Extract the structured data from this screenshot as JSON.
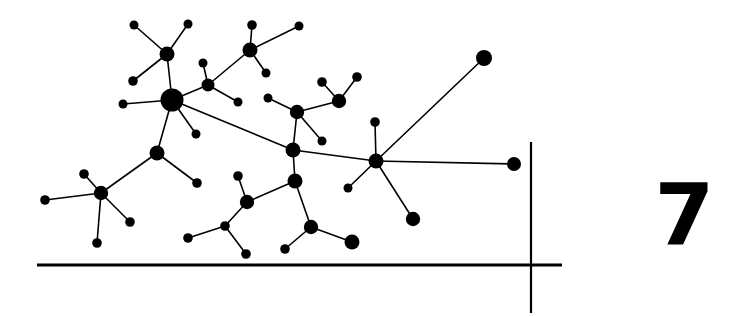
{
  "figure": {
    "number_label": "7",
    "background_color": "#ffffff",
    "ink_color": "#000000"
  },
  "rules": {
    "baseline": {
      "x1": 37,
      "y1": 265,
      "x2": 562,
      "y2": 265,
      "width": 3.2
    },
    "vertical": {
      "x1": 531,
      "y1": 142,
      "x2": 531,
      "y2": 313,
      "width": 2.2
    }
  },
  "graph": {
    "edge_width": 1.6,
    "nodes": [
      {
        "id": "n1",
        "x": 167,
        "y": 54,
        "r": 7.5
      },
      {
        "id": "n2",
        "x": 134,
        "y": 25,
        "r": 4.5
      },
      {
        "id": "n3",
        "x": 188,
        "y": 24,
        "r": 4.5
      },
      {
        "id": "n4",
        "x": 133,
        "y": 81,
        "r": 4.8
      },
      {
        "id": "n5",
        "x": 172,
        "y": 100,
        "r": 11.5
      },
      {
        "id": "n6",
        "x": 123,
        "y": 104,
        "r": 4.5
      },
      {
        "id": "n7",
        "x": 196,
        "y": 134,
        "r": 4.5
      },
      {
        "id": "n8",
        "x": 208,
        "y": 85,
        "r": 6.5
      },
      {
        "id": "n9",
        "x": 203,
        "y": 63,
        "r": 4.5
      },
      {
        "id": "n10",
        "x": 238,
        "y": 102,
        "r": 4.5
      },
      {
        "id": "n11",
        "x": 250,
        "y": 50,
        "r": 7.5
      },
      {
        "id": "n12",
        "x": 252,
        "y": 25,
        "r": 4.8
      },
      {
        "id": "n13",
        "x": 299,
        "y": 26,
        "r": 4.5
      },
      {
        "id": "n14",
        "x": 266,
        "y": 73,
        "r": 4.5
      },
      {
        "id": "n15",
        "x": 157,
        "y": 153,
        "r": 7.5
      },
      {
        "id": "n16",
        "x": 101,
        "y": 193,
        "r": 7.2
      },
      {
        "id": "n17",
        "x": 84,
        "y": 174,
        "r": 4.8
      },
      {
        "id": "n18",
        "x": 45,
        "y": 200,
        "r": 4.8
      },
      {
        "id": "n19",
        "x": 130,
        "y": 222,
        "r": 4.8
      },
      {
        "id": "n20",
        "x": 97,
        "y": 243,
        "r": 4.8
      },
      {
        "id": "n21",
        "x": 197,
        "y": 183,
        "r": 4.8
      },
      {
        "id": "n22",
        "x": 293,
        "y": 150,
        "r": 7.5
      },
      {
        "id": "n23",
        "x": 297,
        "y": 112,
        "r": 7.2
      },
      {
        "id": "n24",
        "x": 268,
        "y": 98,
        "r": 4.5
      },
      {
        "id": "n25",
        "x": 322,
        "y": 141,
        "r": 4.5
      },
      {
        "id": "n26",
        "x": 339,
        "y": 101,
        "r": 7.2
      },
      {
        "id": "n27",
        "x": 322,
        "y": 82,
        "r": 4.8
      },
      {
        "id": "n28",
        "x": 357,
        "y": 77,
        "r": 4.8
      },
      {
        "id": "n29",
        "x": 295,
        "y": 181,
        "r": 7.5
      },
      {
        "id": "n30",
        "x": 247,
        "y": 202,
        "r": 7.2
      },
      {
        "id": "n31",
        "x": 238,
        "y": 176,
        "r": 4.8
      },
      {
        "id": "n32",
        "x": 225,
        "y": 226,
        "r": 4.8
      },
      {
        "id": "n33",
        "x": 188,
        "y": 238,
        "r": 4.8
      },
      {
        "id": "n34",
        "x": 246,
        "y": 254,
        "r": 4.8
      },
      {
        "id": "n35",
        "x": 311,
        "y": 227,
        "r": 7.2
      },
      {
        "id": "n36",
        "x": 285,
        "y": 249,
        "r": 4.8
      },
      {
        "id": "n37",
        "x": 352,
        "y": 242,
        "r": 7.5
      },
      {
        "id": "n38",
        "x": 376,
        "y": 161,
        "r": 7.5
      },
      {
        "id": "n39",
        "x": 375,
        "y": 122,
        "r": 4.8
      },
      {
        "id": "n40",
        "x": 348,
        "y": 188,
        "r": 4.5
      },
      {
        "id": "n41",
        "x": 413,
        "y": 219,
        "r": 7.2
      },
      {
        "id": "n42",
        "x": 484,
        "y": 58,
        "r": 8.0
      },
      {
        "id": "n43",
        "x": 514,
        "y": 164,
        "r": 7.0
      }
    ],
    "edges": [
      [
        "n1",
        "n2"
      ],
      [
        "n1",
        "n3"
      ],
      [
        "n1",
        "n4"
      ],
      [
        "n1",
        "n5"
      ],
      [
        "n5",
        "n6"
      ],
      [
        "n5",
        "n7"
      ],
      [
        "n5",
        "n8"
      ],
      [
        "n5",
        "n15"
      ],
      [
        "n5",
        "n22"
      ],
      [
        "n8",
        "n9"
      ],
      [
        "n8",
        "n10"
      ],
      [
        "n8",
        "n11"
      ],
      [
        "n11",
        "n12"
      ],
      [
        "n11",
        "n13"
      ],
      [
        "n11",
        "n14"
      ],
      [
        "n15",
        "n16"
      ],
      [
        "n15",
        "n21"
      ],
      [
        "n16",
        "n17"
      ],
      [
        "n16",
        "n18"
      ],
      [
        "n16",
        "n19"
      ],
      [
        "n16",
        "n20"
      ],
      [
        "n22",
        "n23"
      ],
      [
        "n22",
        "n29"
      ],
      [
        "n22",
        "n38"
      ],
      [
        "n23",
        "n24"
      ],
      [
        "n23",
        "n25"
      ],
      [
        "n23",
        "n26"
      ],
      [
        "n26",
        "n27"
      ],
      [
        "n26",
        "n28"
      ],
      [
        "n29",
        "n30"
      ],
      [
        "n29",
        "n35"
      ],
      [
        "n30",
        "n31"
      ],
      [
        "n30",
        "n32"
      ],
      [
        "n32",
        "n33"
      ],
      [
        "n32",
        "n34"
      ],
      [
        "n35",
        "n36"
      ],
      [
        "n35",
        "n37"
      ],
      [
        "n38",
        "n39"
      ],
      [
        "n38",
        "n40"
      ],
      [
        "n38",
        "n41"
      ],
      [
        "n38",
        "n42"
      ],
      [
        "n38",
        "n43"
      ]
    ]
  }
}
